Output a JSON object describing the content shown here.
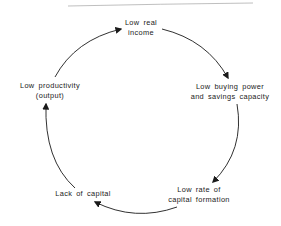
{
  "diagram": {
    "type": "cycle",
    "title": "",
    "top_caption": "",
    "nodes": [
      {
        "id": "low-real-income",
        "line1": "Low  real",
        "line2": "income"
      },
      {
        "id": "low-buying-power",
        "line1": "Low  buying  power",
        "line2": "and  savings  capacity"
      },
      {
        "id": "low-rate-capital-formation",
        "line1": "Low  rate  of",
        "line2": "capital  formation"
      },
      {
        "id": "lack-of-capital",
        "line1": "Lack  of  capital",
        "line2": ""
      },
      {
        "id": "low-productivity",
        "line1": "Low  productivity",
        "line2": "(output)"
      }
    ],
    "edges": [
      {
        "from": "low-productivity",
        "to": "low-real-income"
      },
      {
        "from": "low-real-income",
        "to": "low-buying-power"
      },
      {
        "from": "low-buying-power",
        "to": "low-rate-capital-formation"
      },
      {
        "from": "low-rate-capital-formation",
        "to": "lack-of-capital"
      },
      {
        "from": "lack-of-capital",
        "to": "low-productivity"
      }
    ],
    "colors": {
      "arrow": "#1a1a1a",
      "text": "#1a1a1a",
      "top_rule": "#b5b5b5"
    }
  }
}
